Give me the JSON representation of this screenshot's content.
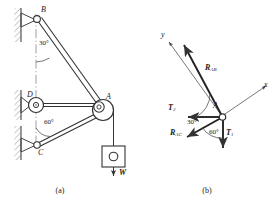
{
  "figure": {
    "title_a": "(a)",
    "title_b": "(b)"
  },
  "panel_a": {
    "points": {
      "B": "B",
      "D": "D",
      "A": "A",
      "C": "C"
    },
    "angles": {
      "at_B": "30°",
      "at_C": "60°"
    },
    "load_label": "W",
    "icons": {
      "pin_support_b": "pin-support-icon",
      "pin_support_d": "pin-support-icon",
      "pin_support_c": "pin-support-icon",
      "hatched_wall": "hatched-wall-icon",
      "pulley": "pulley-icon",
      "weight_block": "weight-block-icon",
      "centerline": "centerline-icon"
    }
  },
  "panel_b": {
    "axes": {
      "x": "x",
      "y": "y"
    },
    "point": "A",
    "forces": [
      {
        "name": "R_AB",
        "symbol": "R",
        "subscript": "AB"
      },
      {
        "name": "R_AC",
        "symbol": "R",
        "subscript": "AC"
      },
      {
        "name": "T_2",
        "symbol": "T",
        "subscript": "2"
      },
      {
        "name": "T_1",
        "symbol": "T",
        "subscript": "1"
      }
    ],
    "angles": {
      "from_T2_to_RAB": "30°",
      "from_RAC_to_T1": "60°"
    },
    "icons": {
      "force-arrow": "arrow-icon",
      "joint-node": "pin-node-icon"
    }
  }
}
